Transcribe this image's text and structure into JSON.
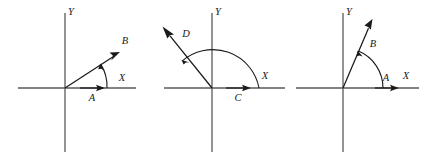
{
  "figure": {
    "background_color": "#ffffff",
    "axis_color": "#5a5a5a",
    "ink_color": "#1a1a1a",
    "diagrams": [
      {
        "id": "diagram-1",
        "origin": {
          "x": 65,
          "y": 88
        },
        "axis_labels": {
          "x": "X",
          "y": "Y"
        },
        "x_axis_label_pos": {
          "x": 122,
          "y": 81
        },
        "y_axis_label_pos": {
          "x": 71,
          "y": 15
        },
        "x_axis": {
          "x1": 18,
          "y1": 88,
          "x2": 136,
          "y2": 88
        },
        "y_axis": {
          "x1": 65,
          "y1": 13,
          "x2": 65,
          "y2": 152
        },
        "vectors": [
          {
            "name": "A",
            "label": "A",
            "label_pos": {
              "x": 92,
              "y": 101
            },
            "from": {
              "x": 80,
              "y": 88
            },
            "to": {
              "x": 104,
              "y": 88
            },
            "angle_deg": 0,
            "description": "short arrow along positive X axis"
          },
          {
            "name": "B",
            "label": "B",
            "label_pos": {
              "x": 125,
              "y": 44
            },
            "from": {
              "x": 65,
              "y": 88
            },
            "to": {
              "x": 120,
              "y": 52
            },
            "angle_deg": 33,
            "description": "arrow into first quadrant at a shallow angle"
          }
        ],
        "angle_arc": {
          "center": {
            "x": 65,
            "y": 88
          },
          "radius": 42,
          "start_deg": 0,
          "end_deg": 33,
          "arrow_at": "end",
          "description": "small arc from X axis counterclockwise to vector B"
        }
      },
      {
        "id": "diagram-2",
        "origin": {
          "x": 212,
          "y": 88
        },
        "axis_labels": {
          "x": "X",
          "y": "Y"
        },
        "x_axis_label_pos": {
          "x": 265,
          "y": 79
        },
        "y_axis_label_pos": {
          "x": 218,
          "y": 15
        },
        "x_axis": {
          "x1": 164,
          "y1": 88,
          "x2": 285,
          "y2": 88
        },
        "y_axis": {
          "x1": 212,
          "y1": 13,
          "x2": 212,
          "y2": 152
        },
        "vectors": [
          {
            "name": "C",
            "label": "C",
            "label_pos": {
              "x": 238,
              "y": 101
            },
            "from": {
              "x": 226,
              "y": 88
            },
            "to": {
              "x": 250,
              "y": 88
            },
            "angle_deg": 0,
            "description": "short arrow along positive X axis"
          },
          {
            "name": "D",
            "label": "D",
            "label_pos": {
              "x": 186,
              "y": 37
            },
            "from": {
              "x": 212,
              "y": 88
            },
            "to": {
              "x": 163,
              "y": 27
            },
            "angle_deg": 129,
            "description": "long arrow into second quadrant, up and to the left"
          }
        ],
        "angle_arc": {
          "center": {
            "x": 212,
            "y": 88
          },
          "radius": 47,
          "start_deg": 0,
          "end_deg": 129,
          "arrow_at": "end",
          "description": "large arc from X axis counterclockwise past Y axis to vector D"
        }
      },
      {
        "id": "diagram-3",
        "origin": {
          "x": 343,
          "y": 88
        },
        "axis_labels": {
          "x": "X",
          "y": "Y"
        },
        "x_axis_label_pos": {
          "x": 406,
          "y": 79
        },
        "y_axis_label_pos": {
          "x": 349,
          "y": 15
        },
        "x_axis": {
          "x1": 296,
          "y1": 88,
          "x2": 419,
          "y2": 88
        },
        "y_axis": {
          "x1": 343,
          "y1": 13,
          "x2": 343,
          "y2": 152
        },
        "vectors": [
          {
            "name": "A",
            "label": "A",
            "label_pos": {
              "x": 386,
              "y": 81
            },
            "from": {
              "x": 375,
              "y": 88
            },
            "to": {
              "x": 398,
              "y": 88
            },
            "angle_deg": 0,
            "description": "short arrow along positive X axis"
          },
          {
            "name": "B",
            "label": "B",
            "label_pos": {
              "x": 373,
              "y": 47
            },
            "from": {
              "x": 343,
              "y": 88
            },
            "to": {
              "x": 372,
              "y": 20
            },
            "angle_deg": 67,
            "description": "steep arrow into first quadrant near the Y axis"
          }
        ],
        "angle_arc": {
          "center": {
            "x": 343,
            "y": 88
          },
          "radius": 40,
          "start_deg": 0,
          "end_deg": 67,
          "arrow_at": "end",
          "description": "medium arc from X axis counterclockwise to vector B"
        }
      }
    ]
  }
}
